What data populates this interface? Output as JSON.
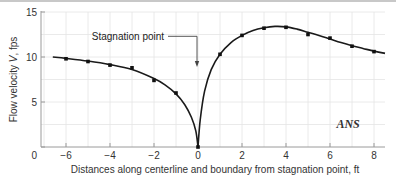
{
  "chart_data": {
    "type": "scatter",
    "title": "",
    "xlabel": "Distances along centerline and boundary from stagnation point, ft",
    "ylabel": "Flow velocity V, fps",
    "xlim": [
      -7,
      8.5
    ],
    "ylim": [
      0,
      15
    ],
    "x_ticks": [
      -6,
      -4,
      -2,
      0,
      2,
      4,
      6,
      8
    ],
    "x_tick_labels": [
      "−6",
      "−4",
      "−2",
      "0",
      "2",
      "4",
      "6",
      "8"
    ],
    "y_ticks": [
      0,
      5,
      10,
      15
    ],
    "y_tick_labels": [
      "0",
      "5",
      "10",
      "15"
    ],
    "grid": true,
    "legend": null,
    "series": [
      {
        "name": "Measured points",
        "type": "scatter",
        "x": [
          -6,
          -5,
          -4,
          -3,
          -2,
          -1,
          0,
          1,
          2,
          3,
          4,
          5,
          6,
          7,
          8
        ],
        "y": [
          9.8,
          9.5,
          9.1,
          8.8,
          7.4,
          6.0,
          0,
          10.3,
          12.4,
          13.2,
          13.3,
          12.5,
          12.1,
          11.2,
          10.6
        ]
      },
      {
        "name": "Smooth curve",
        "type": "line",
        "x": [
          -6.6,
          -6,
          -5,
          -4,
          -3,
          -2,
          -1.5,
          -1,
          -0.6,
          -0.3,
          -0.1,
          0,
          0.1,
          0.3,
          0.6,
          1,
          1.5,
          2,
          2.5,
          3,
          3.5,
          4,
          4.5,
          5,
          5.5,
          6,
          6.5,
          7,
          7.5,
          8,
          8.5
        ],
        "y": [
          10.0,
          9.85,
          9.55,
          9.15,
          8.6,
          7.6,
          6.9,
          5.9,
          4.7,
          3.3,
          1.8,
          0,
          3.0,
          6.2,
          8.6,
          10.3,
          11.6,
          12.4,
          12.95,
          13.25,
          13.4,
          13.35,
          13.1,
          12.75,
          12.4,
          12.0,
          11.6,
          11.25,
          10.95,
          10.65,
          10.4
        ]
      }
    ],
    "annotations": [
      {
        "text": "Stagnation point",
        "arrow_to": [
          0,
          9
        ],
        "text_at": [
          -3.1,
          12.3
        ]
      },
      {
        "text": "ANS",
        "at": [
          6.7,
          2.6
        ],
        "style": "italic bold serif"
      }
    ]
  }
}
